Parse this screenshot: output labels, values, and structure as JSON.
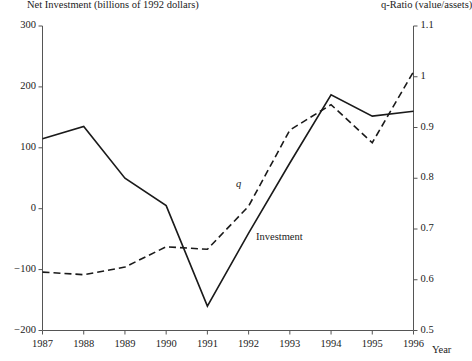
{
  "titles": {
    "left_axis": "Net Investment (billions of 1992 dollars)",
    "right_axis": "q-Ratio (value/assets)",
    "x_axis": "Year"
  },
  "series_labels": {
    "q": "q",
    "investment": "Investment"
  },
  "axes": {
    "left_ticks": [
      "300",
      "200",
      "100",
      "0",
      "-100",
      "-200"
    ],
    "right_ticks": [
      "1.1",
      "1",
      "0.9",
      "0.8",
      "0.7",
      "0.6",
      "0.5"
    ],
    "x_ticks": [
      "1987",
      "1988",
      "1989",
      "1990",
      "1991",
      "1992",
      "1993",
      "1994",
      "1995",
      "1996"
    ]
  },
  "colors": {
    "line": "#1a1a1a",
    "axis": "#555555",
    "background": "#ffffff"
  },
  "chart_data": {
    "type": "line",
    "title": "",
    "xlabel": "Year",
    "ylabel": "Net Investment (billions of 1992 dollars)",
    "y2label": "q-Ratio (value/assets)",
    "grid": false,
    "legend": "inline-annotations",
    "x": [
      1987,
      1988,
      1989,
      1990,
      1991,
      1992,
      1993,
      1994,
      1995,
      1996
    ],
    "ylim": [
      -200,
      300
    ],
    "y2lim": [
      0.5,
      1.1
    ],
    "series": [
      {
        "name": "Investment",
        "axis": "left",
        "style": "solid",
        "values": [
          115,
          135,
          50,
          5,
          -160,
          -40,
          75,
          187,
          152,
          160
        ]
      },
      {
        "name": "q",
        "axis": "right",
        "style": "dashed",
        "values": [
          0.615,
          0.61,
          0.625,
          0.665,
          0.66,
          0.745,
          0.895,
          0.945,
          0.87,
          1.01
        ]
      }
    ]
  }
}
